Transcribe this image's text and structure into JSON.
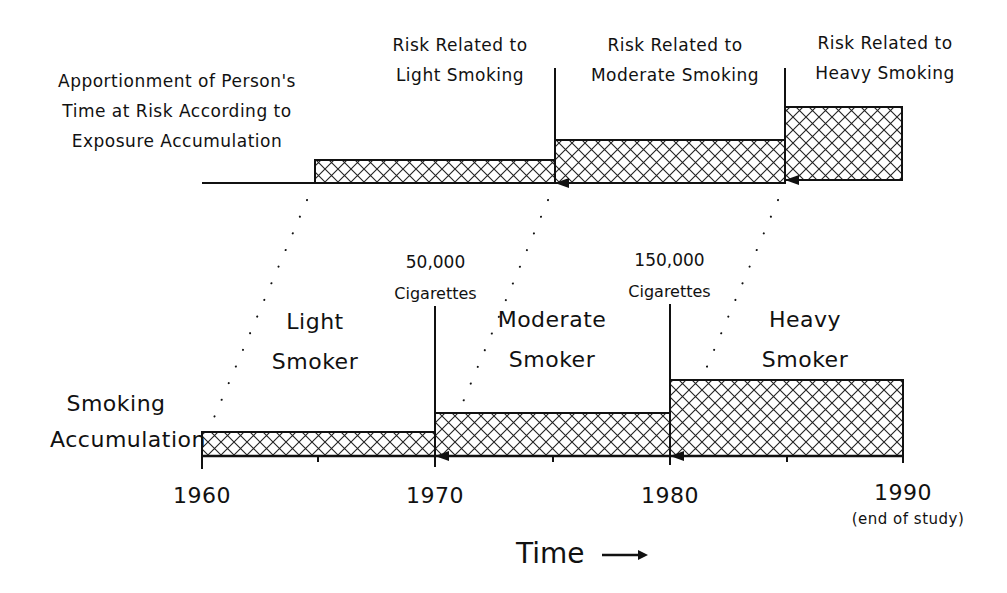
{
  "diagram": {
    "top_title": [
      "Apportionment of Person's",
      "Time at Risk According to",
      "Exposure Accumulation"
    ],
    "risk_labels": [
      {
        "line1": "Risk Related to",
        "line2": "Light Smoking"
      },
      {
        "line1": "Risk Related to",
        "line2": "Moderate Smoking"
      },
      {
        "line1": "Risk Related to",
        "line2": "Heavy Smoking"
      }
    ],
    "smoker_labels": [
      {
        "line1": "Light",
        "line2": "Smoker"
      },
      {
        "line1": "Moderate",
        "line2": "Smoker"
      },
      {
        "line1": "Heavy",
        "line2": "Smoker"
      }
    ],
    "thresholds": [
      {
        "amount": "50,000",
        "unit": "Cigarettes"
      },
      {
        "amount": "150,000",
        "unit": "Cigarettes"
      }
    ],
    "y_label": [
      "Smoking",
      "Accumulation"
    ],
    "years": [
      "1960",
      "1970",
      "1980",
      "1990"
    ],
    "end_note": "(end of study)",
    "x_label": "Time",
    "x_arrow": "→",
    "colors": {
      "ink": "#111111",
      "background": "#ffffff"
    }
  }
}
